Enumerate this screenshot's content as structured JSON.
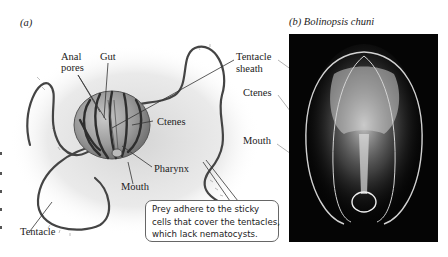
{
  "figure": {
    "panel_a": {
      "label": "(a)",
      "labels": {
        "anal_pores_line1": "Anal",
        "anal_pores_line2": "pores",
        "gut": "Gut",
        "tentacle_sheath_line1": "Tentacle",
        "tentacle_sheath_line2": "sheath",
        "ctenes": "Ctenes",
        "pharynx": "Pharynx",
        "mouth": "Mouth",
        "tentacle": "Tentacle"
      },
      "callout": {
        "line1": "Prey adhere to the sticky",
        "line2": "cells that cover the tentacles,",
        "line3": "which lack nematocysts."
      }
    },
    "panel_b": {
      "label": "(b)  Bolinopsis chuni",
      "labels": {
        "tentacle_sheath_line1": "Tentacle",
        "tentacle_sheath_line2": "sheath",
        "ctenes": "Ctenes",
        "mouth": "Mouth"
      }
    }
  },
  "colors": {
    "body_fill": "#9a9a9a",
    "comb_rows": "#2e2e2e",
    "shadow": "#d4d4d4",
    "photo_bg": "#050505",
    "leader": "#333333"
  }
}
